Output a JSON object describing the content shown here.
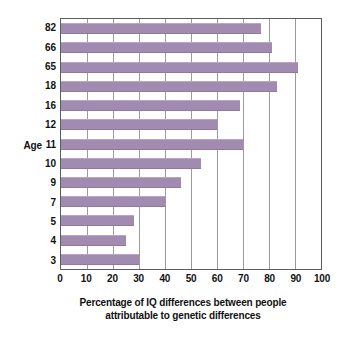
{
  "chart_data": {
    "type": "bar",
    "orientation": "horizontal",
    "title": "",
    "xlabel": "Percentage of IQ differences between people attributable to genetic differences",
    "xlabel_lines": [
      "Percentage of IQ differences between people",
      "attributable to genetic differences"
    ],
    "ylabel": "Age",
    "categories": [
      "82",
      "66",
      "65",
      "18",
      "16",
      "12",
      "11",
      "10",
      "9",
      "7",
      "5",
      "4",
      "3"
    ],
    "values": [
      77,
      81,
      91,
      83,
      69,
      60,
      70,
      54,
      46,
      40,
      28,
      25,
      30
    ],
    "xlim": [
      0,
      100
    ],
    "xticks": [
      0,
      10,
      20,
      30,
      40,
      50,
      60,
      70,
      80,
      90,
      100
    ],
    "xtick_labels": [
      "0",
      "10",
      "20",
      "30",
      "40",
      "50",
      "60",
      "70",
      "80",
      "90",
      "100"
    ],
    "grid": "vertical",
    "legend": "none",
    "bar_color": "#a28bb0",
    "axis_color": "#5b5b62",
    "gridline_color": "#9a9aa2",
    "background_color": "#ffffff"
  }
}
